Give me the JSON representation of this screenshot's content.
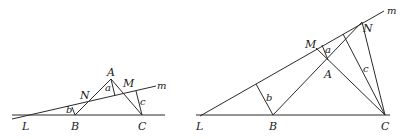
{
  "figures": [
    {
      "id": "left",
      "points": {
        "L": {
          "label": "L"
        },
        "B": {
          "label": "B"
        },
        "C": {
          "label": "C"
        },
        "A": {
          "label": "A"
        },
        "N": {
          "label": "N"
        },
        "M": {
          "label": "M"
        }
      },
      "line_label": "m",
      "distances": {
        "a": "a",
        "b": "b",
        "c": "c"
      }
    },
    {
      "id": "right",
      "points": {
        "L": {
          "label": "L"
        },
        "B": {
          "label": "B"
        },
        "C": {
          "label": "C"
        },
        "A": {
          "label": "A"
        },
        "N": {
          "label": "N"
        },
        "M": {
          "label": "M"
        }
      },
      "line_label": "m",
      "distances": {
        "a": "a",
        "b": "b",
        "c": "c"
      }
    }
  ]
}
